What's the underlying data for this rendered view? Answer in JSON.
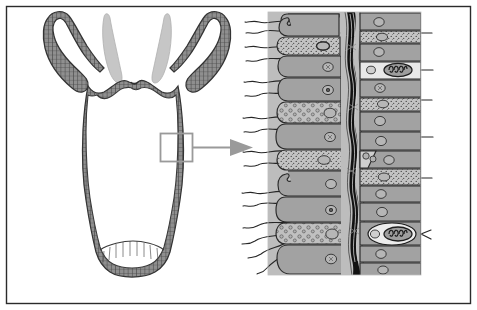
{
  "figure": {
    "title": "Hydra body wall structure with magnified cross-section",
    "subject": "hydra",
    "view": "longitudinal section and magnified body wall detail",
    "background_color": "#ffffff",
    "frame": {
      "border_color": "#2b2b2b",
      "border_width": 1,
      "x": 6,
      "y": 6,
      "width": 465,
      "height": 298
    }
  },
  "left_panel": {
    "name": "whole-organism-longitudinal-section",
    "colors": {
      "wall_fill": "#8f8f8f",
      "wall_outline": "#3a3a3a",
      "inner_tentacle_fill": "#c6c6c6",
      "cell_division_line": "#4a4a4a",
      "lumen_fill": "#ffffff"
    },
    "parts": [
      {
        "label": "tentacle-outer-left",
        "texture": "cellular"
      },
      {
        "label": "tentacle-outer-right",
        "texture": "cellular"
      },
      {
        "label": "tentacle-inner-left",
        "texture": "plain"
      },
      {
        "label": "tentacle-inner-right",
        "texture": "plain"
      },
      {
        "label": "hypostome-mouth",
        "texture": "cellular"
      },
      {
        "label": "body-column",
        "texture": "cellular"
      },
      {
        "label": "gastrovascular-cavity",
        "texture": "plain"
      },
      {
        "label": "basal-disc-foot",
        "texture": "cellular"
      }
    ]
  },
  "callout": {
    "name": "magnification-callout",
    "box": {
      "x": 160,
      "y": 133,
      "width": 32,
      "height": 28,
      "stroke": "#9a9a9a",
      "stroke_width": 2
    },
    "connector": {
      "from_x": 192,
      "to_x": 228,
      "y": 147,
      "stroke": "#9a9a9a"
    },
    "arrow": {
      "tip_x": 253,
      "y": 147,
      "fill": "#9a9a9a"
    }
  },
  "right_panel": {
    "name": "magnified-body-wall-detail",
    "bounds": {
      "x": 268,
      "y": 12,
      "width": 153,
      "height": 263
    },
    "colors": {
      "cell_fill": "#a2a2a2",
      "cell_fill_light": "#c9c9c9",
      "granular_fill": "#bdbdbd",
      "nematocyst_fill": "#e8e8e8",
      "mesoglea_dark": "#121212",
      "mesoglea_fiber": "#d8d8d8",
      "outline": "#2a2a2a",
      "flagella": "#262626",
      "nucleus_fill": "#b6b6b6",
      "panel_bg": "#bdbdbd"
    },
    "layers": [
      {
        "name": "gastrodermis",
        "side": "left",
        "description": "inner digestive cell layer bearing flagella"
      },
      {
        "name": "mesoglea",
        "side": "center",
        "description": "dark acellular gelatinous middle layer"
      },
      {
        "name": "epidermis",
        "side": "right",
        "description": "outer protective cell layer containing nematocysts"
      }
    ],
    "cell_types": [
      {
        "name": "nutritive-muscular-cell",
        "fill": "#a2a2a2",
        "feature": "flagellum"
      },
      {
        "name": "gland-cell",
        "fill": "#bdbdbd",
        "feature": "secretory-granules"
      },
      {
        "name": "interstitial-cell",
        "fill": "#bdbdbd",
        "feature": "small-vesicles"
      },
      {
        "name": "cnidocyte-nematocyst",
        "fill": "#e8e8e8",
        "feature": "coiled-thread-capsule"
      },
      {
        "name": "epitheliomuscular-cell",
        "fill": "#a2a2a2",
        "feature": "nucleus"
      }
    ],
    "counts": {
      "left_cells": 11,
      "right_cells": 14,
      "nematocysts": 2,
      "flagella_bundles": 7
    }
  }
}
